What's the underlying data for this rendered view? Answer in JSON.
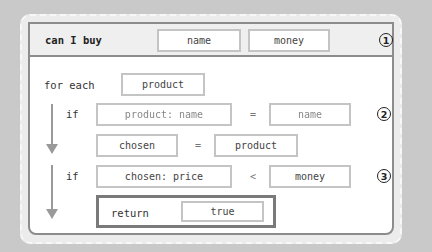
{
  "function": {
    "keyword": "can I buy",
    "params": [
      "name",
      "money"
    ],
    "marker": "1"
  },
  "loop": {
    "keyword": "for each",
    "variable": "product"
  },
  "step2": {
    "keyword": "if",
    "left": "product: name",
    "operator": "=",
    "right": "name",
    "marker": "2",
    "assign_left": "chosen",
    "assign_operator": "=",
    "assign_right": "product"
  },
  "step3": {
    "keyword": "if",
    "left": "chosen: price",
    "operator": "<",
    "right": "money",
    "marker": "3",
    "return_keyword": "return",
    "return_value": "true"
  },
  "colors": {
    "background": "#c9c9c9",
    "card": "#ececec",
    "panel_border": "#8c8c8c",
    "slot_border": "#c4c4c4",
    "return_border": "#7a7a7a"
  }
}
